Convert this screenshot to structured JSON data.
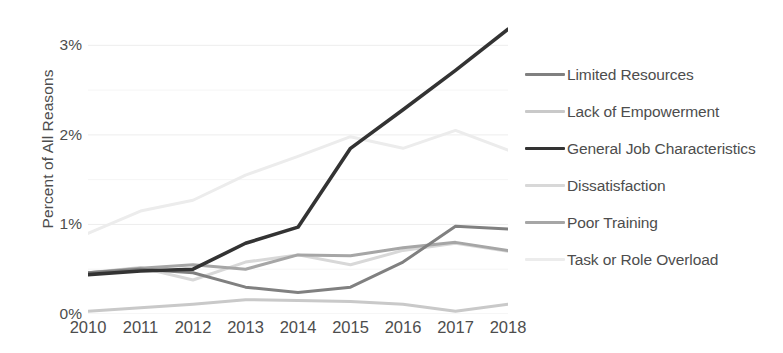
{
  "chart_data": {
    "type": "line",
    "title": "",
    "xlabel": "",
    "ylabel": "Percent of All Reasons",
    "x": [
      2010,
      2011,
      2012,
      2013,
      2014,
      2015,
      2016,
      2017,
      2018
    ],
    "xtick_labels": [
      "2010",
      "2011",
      "2012",
      "2013",
      "2014",
      "2015",
      "2016",
      "2017",
      "2018"
    ],
    "ytick_labels": [
      "0%",
      "1%",
      "2%",
      "3%"
    ],
    "ytick_values": [
      0,
      1,
      2,
      3
    ],
    "ylim": [
      0,
      3.35
    ],
    "yunit": "percent",
    "grid": "horizontal-major-and-minor",
    "minor_gridlines": [
      0.5,
      1.5,
      2.5
    ],
    "legend_position": "right",
    "series": [
      {
        "name": "Limited Resources",
        "color": "#808080",
        "width": 3.0,
        "values": [
          0.46,
          0.5,
          0.46,
          0.3,
          0.24,
          0.3,
          0.58,
          0.98,
          0.95
        ]
      },
      {
        "name": "Lack of Empowerment",
        "color": "#c9c9c9",
        "width": 3.0,
        "values": [
          0.03,
          0.07,
          0.11,
          0.16,
          0.15,
          0.14,
          0.11,
          0.03,
          0.11
        ]
      },
      {
        "name": "General Job Characteristics",
        "color": "#333333",
        "width": 3.6,
        "values": [
          0.44,
          0.48,
          0.5,
          0.79,
          0.97,
          1.85,
          2.28,
          2.72,
          3.18
        ]
      },
      {
        "name": "Dissatisfaction",
        "color": "#d8d8d8",
        "width": 3.0,
        "values": [
          0.46,
          0.52,
          0.38,
          0.58,
          0.66,
          0.55,
          0.71,
          0.79,
          0.7
        ]
      },
      {
        "name": "Poor Training",
        "color": "#a6a6a6",
        "width": 3.0,
        "values": [
          0.46,
          0.51,
          0.55,
          0.5,
          0.66,
          0.65,
          0.74,
          0.8,
          0.71
        ]
      },
      {
        "name": "Task or Role Overload",
        "color": "#ececec",
        "width": 3.0,
        "values": [
          0.9,
          1.15,
          1.27,
          1.55,
          1.76,
          1.98,
          1.85,
          2.05,
          1.83
        ]
      }
    ]
  },
  "axis": {
    "y_title": "Percent of All Reasons"
  },
  "colors": {
    "text": "#4d4d4d",
    "gridline_major": "#ededed",
    "gridline_minor": "#f5f5f5",
    "background": "#ffffff"
  }
}
